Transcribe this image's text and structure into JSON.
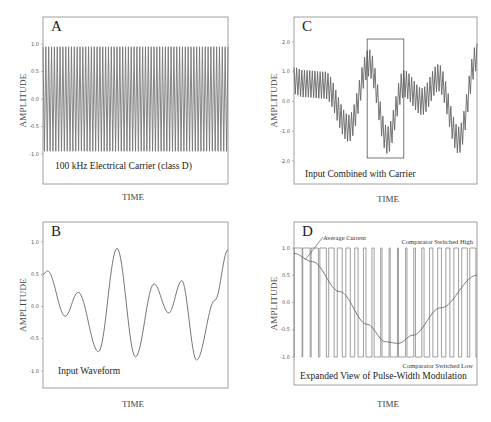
{
  "figure_title": "Class D pulse-width modulation illustration",
  "chart_data": [
    {
      "id": "A",
      "type": "line",
      "panel_letter": "A",
      "caption": "100 kHz Electrical Carrier (class D)",
      "xlabel": "TIME",
      "ylabel": "AMPLITUDE",
      "ylim": [
        -1.0,
        1.0
      ],
      "yticks": [
        1.0,
        0.5,
        0.0,
        -0.5,
        -1.0
      ],
      "ytick_labels": [
        "1.0",
        "0.5",
        "0.0",
        "-0.5",
        "-1.0"
      ],
      "series": [
        {
          "name": "carrier",
          "kind": "triangle-carrier",
          "amplitude": 0.95,
          "cycles": 65
        }
      ]
    },
    {
      "id": "B",
      "type": "line",
      "panel_letter": "B",
      "caption": "Input Waveform",
      "xlabel": "TIME",
      "ylabel": "AMPLITUDE",
      "ylim": [
        -1.2,
        1.2
      ],
      "yticks": [
        1.0,
        0.5,
        0.0,
        -0.5,
        -1.0
      ],
      "ytick_labels": [
        "1.0",
        "0.5",
        "0.0",
        "-0.5",
        "-1.0"
      ],
      "series": [
        {
          "name": "input",
          "x": [
            0.0,
            0.025,
            0.12,
            0.19,
            0.3,
            0.4,
            0.5,
            0.6,
            0.68,
            0.75,
            0.83,
            0.93,
            1.0
          ],
          "y": [
            0.5,
            0.55,
            -0.15,
            0.22,
            -0.7,
            0.9,
            -0.78,
            0.35,
            -0.1,
            0.4,
            -0.83,
            0.1,
            0.88
          ]
        }
      ]
    },
    {
      "id": "C",
      "type": "line",
      "panel_letter": "C",
      "caption": "Input Combined with Carrier",
      "xlabel": "TIME",
      "ylabel": "AMPLITUDE",
      "ylim": [
        -2.4,
        2.4
      ],
      "yticks": [
        2.0,
        1.0,
        0.0,
        -1.0,
        -2.0
      ],
      "ytick_labels": [
        "2.0",
        "1.0",
        "0.0",
        "-1.0",
        "-2.0"
      ],
      "highlight_box": {
        "x_range": [
          0.4,
          0.6
        ],
        "y_range": [
          -1.9,
          2.1
        ],
        "label": "zoomed region"
      },
      "series": [
        {
          "name": "combined",
          "kind": "input-plus-carrier",
          "carrier_amplitude": 0.45,
          "cycles": 70,
          "envelope_center_x": [
            0.0,
            0.05,
            0.17,
            0.3,
            0.41,
            0.51,
            0.6,
            0.7,
            0.79,
            0.9,
            1.0
          ],
          "envelope_center_y": [
            0.7,
            0.6,
            0.55,
            -0.9,
            1.3,
            -1.3,
            0.6,
            0.0,
            0.8,
            -1.3,
            1.5
          ]
        }
      ]
    },
    {
      "id": "D",
      "type": "line",
      "panel_letter": "D",
      "caption": "Expanded View of Pulse-Width Modulation",
      "xlabel": "TIME",
      "ylabel": "AMPLITUDE",
      "ylim": [
        -1.0,
        1.0
      ],
      "yticks": [
        1.0,
        0.5,
        0.0,
        -0.5,
        -1.0
      ],
      "ytick_labels": [
        "1.0",
        "0.5",
        "0.0",
        "-0.5",
        "-1.0"
      ],
      "annotations": {
        "average_current": "Average Current",
        "high": "Comparator Switched High",
        "low": "Comparator Switched Low"
      },
      "series": [
        {
          "name": "pwm",
          "kind": "pwm-square",
          "pulses": 22,
          "levels": [
            1.0,
            -1.0
          ]
        },
        {
          "name": "average current",
          "x": [
            0.0,
            0.1,
            0.25,
            0.4,
            0.5,
            0.57,
            0.65,
            0.8,
            1.0
          ],
          "y": [
            0.9,
            0.75,
            0.2,
            -0.4,
            -0.72,
            -0.75,
            -0.6,
            -0.1,
            0.5
          ]
        }
      ]
    }
  ]
}
